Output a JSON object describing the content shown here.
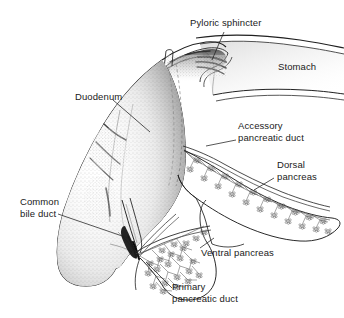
{
  "figure": {
    "background_color": "#ffffff",
    "ink_color": "#1a1a1a",
    "width": 344,
    "height": 318
  },
  "labels": {
    "pyloric_sphincter": "Pyloric sphincter",
    "stomach": "Stomach",
    "duodenum": "Duodenum",
    "accessory_pancreatic_duct": "Accessory\npancreatic duct",
    "dorsal_pancreas": "Dorsal\npancreas",
    "common_bile_duct": "Common\nbile duct",
    "ventral_pancreas": "Ventral pancreas",
    "primary_pancreatic_duct": "Primary\npancreatic duct"
  },
  "structures": [
    {
      "name": "stomach",
      "description": "Stomach body tapering to the right edge"
    },
    {
      "name": "pyloric-sphincter",
      "description": "Thickened muscular ring with dark folds between stomach and duodenum"
    },
    {
      "name": "duodenum",
      "description": "Large curved stippled tube descending to lower left"
    },
    {
      "name": "dorsal-pancreas",
      "description": "Elongated lobe extending right with branching duct tree"
    },
    {
      "name": "ventral-pancreas",
      "description": "Rounded lower lobe with dense acinar branching"
    },
    {
      "name": "accessory-pancreatic-duct",
      "description": "Duct entering duodenum superior to the primary duct"
    },
    {
      "name": "primary-pancreatic-duct",
      "description": "Main duct draining the ventral pancreas into the ampulla"
    },
    {
      "name": "common-bile-duct",
      "description": "Duct converging with the pancreatic duct at the ampulla"
    },
    {
      "name": "cut-duct-stub",
      "description": "Small cut tubular stub on the superior duodenum"
    }
  ]
}
